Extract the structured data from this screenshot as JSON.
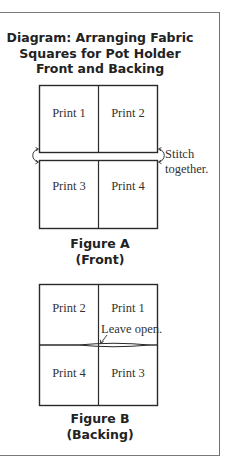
{
  "title": {
    "line1": "Diagram: Arranging Fabric",
    "line2": "Squares for Pot Holder",
    "line3": "Front and Backing"
  },
  "figure_a": {
    "cells": [
      "Print 1",
      "Print 2",
      "Print 3",
      "Print 4"
    ],
    "annotation": {
      "line1": "Stitch",
      "line2": "together."
    },
    "caption": {
      "line1": "Figure A",
      "line2": "(Front)"
    }
  },
  "figure_b": {
    "cells": [
      "Print 2",
      "Print 1",
      "Print 4",
      "Print 3"
    ],
    "annotation": "Leave open.",
    "caption": {
      "line1": "Figure B",
      "line2": "(Backing)"
    }
  },
  "colors": {
    "line": "#2a2a2a",
    "frame": "#7a7a7a",
    "text": "#222222"
  }
}
